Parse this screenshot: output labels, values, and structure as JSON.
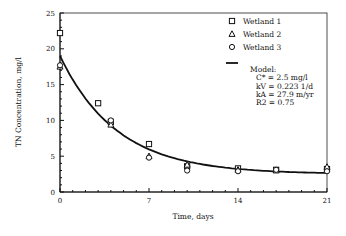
{
  "chart_data": {
    "type": "scatter",
    "title": "",
    "xlabel": "Time, days",
    "ylabel": "TN Concentration, mg/l",
    "xlim": [
      0,
      21
    ],
    "ylim": [
      0,
      25
    ],
    "xticks": [
      0,
      7,
      14,
      21
    ],
    "yticks": [
      0,
      5,
      10,
      15,
      20,
      25
    ],
    "grid": false,
    "legend_position": "top-right",
    "series": [
      {
        "name": "Wetland 1",
        "marker": "square",
        "x": [
          0,
          3,
          4,
          7,
          10,
          14,
          17,
          21
        ],
        "y": [
          22.2,
          12.4,
          9.8,
          6.7,
          3.6,
          3.3,
          3.1,
          3.2
        ]
      },
      {
        "name": "Wetland 2",
        "marker": "triangle",
        "x": [
          0,
          4,
          7,
          10,
          14,
          17,
          21
        ],
        "y": [
          17.5,
          9.4,
          5.0,
          3.8,
          3.1,
          3.0,
          3.5
        ]
      },
      {
        "name": "Wetland 3",
        "marker": "circle",
        "x": [
          0,
          4,
          7,
          10,
          14,
          17,
          21
        ],
        "y": [
          17.7,
          10.0,
          4.8,
          3.0,
          2.9,
          3.1,
          2.9
        ]
      }
    ],
    "model": {
      "name": "Model",
      "C0": 19.0,
      "C_star": 2.5,
      "kV": 0.223,
      "annotation": [
        "Model:",
        "C* = 2.5 mg/l",
        "kV = 0.223 1/d",
        "kA = 27.9 m/yr",
        "R2 = 0.75"
      ]
    }
  }
}
